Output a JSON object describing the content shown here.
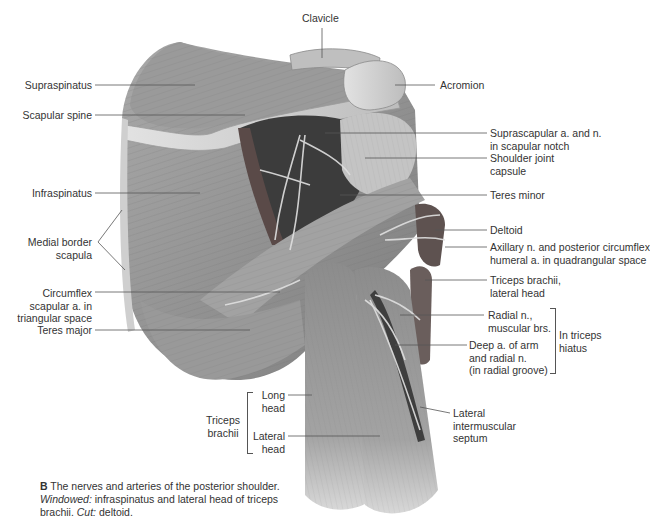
{
  "figure": {
    "caption": {
      "letter": "B",
      "text_main": "The nerves and arteries of the posterior shoulder.",
      "windowed_label": "Windowed:",
      "windowed_text": "infraspinatus and lateral head of triceps brachii.",
      "cut_label": "Cut:",
      "cut_text": "deltoid."
    },
    "labels_left": [
      {
        "id": "supraspinatus",
        "text": "Supraspinatus"
      },
      {
        "id": "scapular-spine",
        "text": "Scapular spine"
      },
      {
        "id": "infraspinatus",
        "text": "Infraspinatus"
      },
      {
        "id": "medial-border-scapula",
        "line1": "Medial border",
        "line2": "scapula"
      },
      {
        "id": "circumflex-scapular-a",
        "line1": "Circumflex",
        "line2": "scapular a. in",
        "line3": "triangular space"
      },
      {
        "id": "teres-major",
        "text": "Teres major"
      }
    ],
    "label_top": {
      "id": "clavicle",
      "text": "Clavicle"
    },
    "labels_right": [
      {
        "id": "acromion",
        "text": "Acromion"
      },
      {
        "id": "suprascapular-a-n",
        "line1": "Suprascapular a. and n.",
        "line2": "in scapular notch"
      },
      {
        "id": "shoulder-joint-capsule",
        "line1": "Shoulder joint",
        "line2": "capsule"
      },
      {
        "id": "teres-minor",
        "text": "Teres minor"
      },
      {
        "id": "deltoid",
        "text": "Deltoid"
      },
      {
        "id": "axillary-n",
        "line1": "Axillary n. and posterior circumflex",
        "line2": "humeral a. in quadrangular space"
      },
      {
        "id": "triceps-lateral-head",
        "line1": "Triceps brachii,",
        "line2": "lateral head"
      },
      {
        "id": "radial-n-muscular",
        "line1": "Radial n.,",
        "line2": "muscular brs."
      },
      {
        "id": "deep-a-of-arm",
        "line1": "Deep a. of arm",
        "line2": "and radial n.",
        "line3": "(in radial groove)"
      },
      {
        "id": "lateral-intermuscular-septum",
        "line1": "Lateral",
        "line2": "intermuscular",
        "line3": "septum"
      }
    ],
    "group_triceps_hiatus": {
      "line1": "In triceps",
      "line2": "hiatus"
    },
    "group_triceps_brachii": {
      "line1": "Triceps",
      "line2": "brachii",
      "long_head": {
        "line1": "Long",
        "line2": "head"
      },
      "lateral_head": {
        "line1": "Lateral",
        "line2": "head"
      }
    },
    "colors": {
      "muscle": "#8a8a8a",
      "muscle_light": "#b8b8b8",
      "bone": "#d4d4d4",
      "dark_cavity": "#3a3a3a",
      "leader_line": "#555555"
    }
  }
}
